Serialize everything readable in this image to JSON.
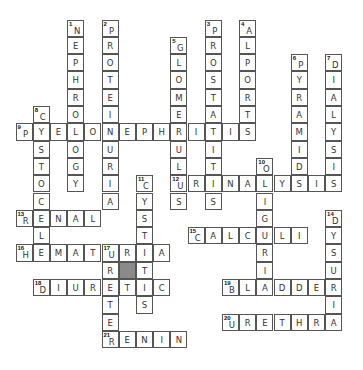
{
  "puzzle": {
    "type": "crossword",
    "entries": [
      {
        "number": 1,
        "direction": "down",
        "answer": "NEPHROLOGY",
        "row": 0,
        "col": 3
      },
      {
        "number": 2,
        "direction": "down",
        "answer": "PROTEINURIA",
        "row": 0,
        "col": 5
      },
      {
        "number": 3,
        "direction": "down",
        "answer": "PROSTATITIS",
        "row": 0,
        "col": 11
      },
      {
        "number": 4,
        "direction": "down",
        "answer": "ALPORTS",
        "row": 0,
        "col": 13
      },
      {
        "number": 5,
        "direction": "down",
        "answer": "GLOMERULUS",
        "row": 1,
        "col": 9
      },
      {
        "number": 6,
        "direction": "down",
        "answer": "PYRAMIDS",
        "row": 2,
        "col": 16
      },
      {
        "number": 7,
        "direction": "down",
        "answer": "DIALYSIS",
        "row": 2,
        "col": 18
      },
      {
        "number": 8,
        "direction": "down",
        "answer": "CYSTOCELE",
        "row": 5,
        "col": 1
      },
      {
        "number": 9,
        "direction": "across",
        "answer": "PYELONEPHRITIS",
        "row": 6,
        "col": 0
      },
      {
        "number": 10,
        "direction": "down",
        "answer": "OLIGURIA",
        "row": 8,
        "col": 14
      },
      {
        "number": 11,
        "direction": "down",
        "answer": "CYSTITIS",
        "row": 9,
        "col": 7
      },
      {
        "number": 12,
        "direction": "across",
        "answer": "URINALYSIS",
        "row": 9,
        "col": 9
      },
      {
        "number": 13,
        "direction": "across",
        "answer": "RENAL",
        "row": 11,
        "col": 0
      },
      {
        "number": 14,
        "direction": "down",
        "answer": "DYSURIA",
        "row": 11,
        "col": 18
      },
      {
        "number": 15,
        "direction": "across",
        "answer": "CALCULI",
        "row": 12,
        "col": 10
      },
      {
        "number": 16,
        "direction": "across",
        "answer": "HEMATURIA",
        "row": 13,
        "col": 0
      },
      {
        "number": 17,
        "direction": "down",
        "answer": "URETER",
        "row": 13,
        "col": 5
      },
      {
        "number": 18,
        "direction": "across",
        "answer": "DIURETIC",
        "row": 15,
        "col": 1
      },
      {
        "number": 19,
        "direction": "across",
        "answer": "BLADDER",
        "row": 15,
        "col": 12
      },
      {
        "number": 20,
        "direction": "across",
        "answer": "URETHRA",
        "row": 17,
        "col": 12
      },
      {
        "number": 21,
        "direction": "across",
        "answer": "RENIN",
        "row": 18,
        "col": 5
      }
    ],
    "shaded_cells": [
      {
        "row": 14,
        "col": 6
      }
    ],
    "colors": {
      "grid_line": "#555555",
      "shaded": "#8a8a8a",
      "letter": "#333333"
    }
  }
}
